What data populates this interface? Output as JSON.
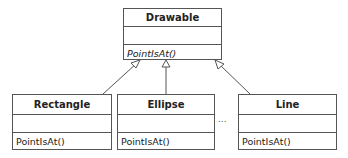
{
  "diagram": {
    "type": "uml-class-inheritance",
    "base_class": {
      "name": "Drawable",
      "attributes": [],
      "operations": [
        "PointIsAt()"
      ],
      "abstract_operations": true
    },
    "subclasses": [
      {
        "name": "Rectangle",
        "attributes": [],
        "operations": [
          "PointIsAt()"
        ]
      },
      {
        "name": "Ellipse",
        "attributes": [],
        "operations": [
          "PointIsAt()"
        ]
      },
      {
        "name": "Line",
        "attributes": [],
        "operations": [
          "PointIsAt()"
        ]
      }
    ],
    "ellipsis": "...",
    "line_color": "#555555"
  }
}
